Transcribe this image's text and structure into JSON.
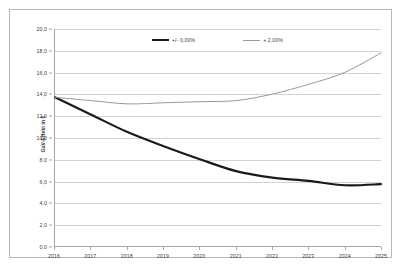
{
  "chart_data": {
    "type": "line",
    "title": "",
    "xlabel": "",
    "ylabel": "GuV-Effekt in €",
    "x": [
      "2016",
      "2017",
      "2018",
      "2019",
      "2020",
      "2021",
      "2022",
      "2023",
      "2024",
      "2025"
    ],
    "categories": [
      "2016",
      "2017",
      "2018",
      "2019",
      "2020",
      "2021",
      "2022",
      "2023",
      "2024",
      "2025"
    ],
    "ylim": [
      0.0,
      20.0
    ],
    "y_ticks": [
      "0,0",
      "2,0",
      "4,0",
      "6,0",
      "8,0",
      "10,0",
      "12,0",
      "14,0",
      "16,0",
      "18,0",
      "20,0"
    ],
    "y_tick_values": [
      0,
      2,
      4,
      6,
      8,
      10,
      12,
      14,
      16,
      18,
      20
    ],
    "grid": true,
    "legend_position": "top-center",
    "series": [
      {
        "name": "+/- 0,00%",
        "color": "#1a1a1a",
        "width": 2.2,
        "values": [
          13.7,
          12.1,
          10.5,
          9.2,
          8.0,
          6.9,
          6.3,
          6.0,
          5.6,
          5.7
        ]
      },
      {
        "name": "+ 2,00%",
        "color": "#9a9a9a",
        "width": 1.0,
        "values": [
          13.7,
          13.4,
          13.1,
          13.2,
          13.3,
          13.4,
          14.0,
          14.9,
          16.0,
          17.8
        ]
      }
    ]
  },
  "legend": {
    "entries": [
      {
        "label": "+/- 0,00%"
      },
      {
        "label": "+ 2,00%"
      }
    ]
  },
  "axes": {
    "y_title": "GuV-Effekt in €"
  }
}
